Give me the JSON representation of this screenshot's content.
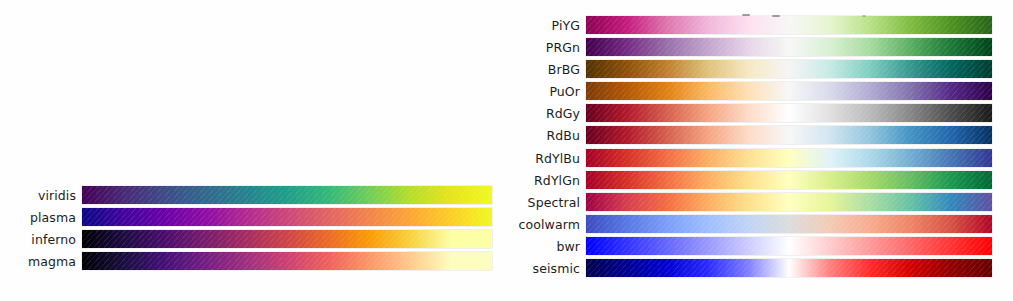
{
  "figure": {
    "background": "#ffffff",
    "label_color": "#1d1d1d"
  },
  "panels": [
    {
      "id": "sequential",
      "category": "Perceptually Uniform Sequential",
      "rows": [
        {
          "label": "viridis",
          "type": "sequential",
          "stops": [
            "#440154",
            "#482878",
            "#3e4a89",
            "#31688e",
            "#26828e",
            "#1f9e89",
            "#35b779",
            "#6ece58",
            "#b5de2b",
            "#e7e419",
            "#f0f921"
          ]
        },
        {
          "label": "plasma",
          "type": "sequential",
          "stops": [
            "#0d0887",
            "#41049d",
            "#6a00a8",
            "#8f0da4",
            "#b12a90",
            "#cc4778",
            "#e16462",
            "#f2844b",
            "#fca636",
            "#fcce25",
            "#f0f921"
          ]
        },
        {
          "label": "inferno",
          "type": "sequential",
          "stops": [
            "#000004",
            "#1b0c41",
            "#4a0c6b",
            "#781c6d",
            "#a52c60",
            "#cf4446",
            "#ed6925",
            "#fb9b06",
            "#f7d13d",
            "#fcffa4",
            "#fcffa4"
          ]
        },
        {
          "label": "magma",
          "type": "sequential",
          "stops": [
            "#000004",
            "#180f3d",
            "#440f76",
            "#721f81",
            "#9e2f7f",
            "#cd4071",
            "#f1605d",
            "#fd9668",
            "#feca8d",
            "#fcfdbf",
            "#fcfdbf"
          ]
        }
      ]
    },
    {
      "id": "diverging",
      "category": "Diverging",
      "rows": [
        {
          "label": "PiYG",
          "type": "diverging",
          "stops": [
            "#8e0152",
            "#c51b7d",
            "#de77ae",
            "#f1b6da",
            "#fde0ef",
            "#f7f7f7",
            "#e6f5d0",
            "#b8e186",
            "#7fbc41",
            "#4d9221",
            "#276419"
          ]
        },
        {
          "label": "PRGn",
          "type": "diverging",
          "stops": [
            "#40004b",
            "#762a83",
            "#9970ab",
            "#c2a5cf",
            "#e7d4e8",
            "#f7f7f7",
            "#d9f0d3",
            "#a6dba0",
            "#5aae61",
            "#1b7837",
            "#00441b"
          ]
        },
        {
          "label": "BrBG",
          "type": "diverging",
          "stops": [
            "#543005",
            "#8c510a",
            "#bf812d",
            "#dfc27d",
            "#f6e8c3",
            "#f5f5f5",
            "#c7eae5",
            "#80cdc1",
            "#35978f",
            "#01665e",
            "#003c30"
          ]
        },
        {
          "label": "PuOr",
          "type": "diverging",
          "stops": [
            "#7f3b08",
            "#b35806",
            "#e08214",
            "#fdb863",
            "#fee0b6",
            "#f7f7f7",
            "#d8daeb",
            "#b2abd2",
            "#8073ac",
            "#542788",
            "#2d004b"
          ]
        },
        {
          "label": "RdGy",
          "type": "diverging",
          "stops": [
            "#67001f",
            "#b2182b",
            "#d6604d",
            "#f4a582",
            "#fddbc7",
            "#ffffff",
            "#e0e0e0",
            "#bababa",
            "#878787",
            "#4d4d4d",
            "#1a1a1a"
          ]
        },
        {
          "label": "RdBu",
          "type": "diverging",
          "stops": [
            "#67001f",
            "#b2182b",
            "#d6604d",
            "#f4a582",
            "#fddbc7",
            "#f7f7f7",
            "#d1e5f0",
            "#92c5de",
            "#4393c3",
            "#2166ac",
            "#053061"
          ]
        },
        {
          "label": "RdYlBu",
          "type": "diverging",
          "stops": [
            "#a50026",
            "#d73027",
            "#f46d43",
            "#fdae61",
            "#fee090",
            "#ffffbf",
            "#e0f3f8",
            "#abd9e9",
            "#74add1",
            "#4575b4",
            "#313695"
          ]
        },
        {
          "label": "RdYlGn",
          "type": "diverging",
          "stops": [
            "#a50026",
            "#d73027",
            "#f46d43",
            "#fdae61",
            "#fee08b",
            "#ffffbf",
            "#d9ef8b",
            "#a6d96a",
            "#66bd63",
            "#1a9850",
            "#006837"
          ]
        },
        {
          "label": "Spectral",
          "type": "diverging",
          "stops": [
            "#9e0142",
            "#d53e4f",
            "#f46d43",
            "#fdae61",
            "#fee08b",
            "#ffffbf",
            "#e6f598",
            "#abdda4",
            "#66c2a5",
            "#3288bd",
            "#5e4fa2"
          ]
        },
        {
          "label": "coolwarm",
          "type": "diverging",
          "stops": [
            "#3b4cc0",
            "#5977e3",
            "#7b9ff9",
            "#9ebeff",
            "#c0d4f5",
            "#dddcdc",
            "#f2cbb7",
            "#f7ac8e",
            "#ee8468",
            "#d65244",
            "#b40426"
          ]
        },
        {
          "label": "bwr",
          "type": "diverging",
          "stops": [
            "#0000ff",
            "#3333ff",
            "#6666ff",
            "#9999ff",
            "#ccccff",
            "#ffffff",
            "#ffcccc",
            "#ff9999",
            "#ff6666",
            "#ff3333",
            "#ff0000"
          ]
        },
        {
          "label": "seismic",
          "type": "diverging",
          "stops": [
            "#00004c",
            "#000090",
            "#0000d4",
            "#2b2bff",
            "#8080ff",
            "#ffffff",
            "#ff8080",
            "#ff2b2b",
            "#d40000",
            "#900000",
            "#660000"
          ]
        }
      ]
    }
  ]
}
